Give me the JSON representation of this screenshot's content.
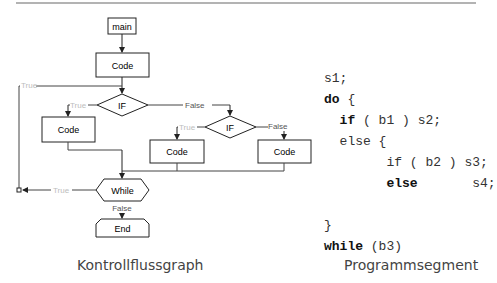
{
  "diagram": {
    "nodes": {
      "main": "main",
      "code_top": "Code",
      "if1": "IF",
      "code_left": "Code",
      "if2": "IF",
      "code_mid": "Code",
      "code_right": "Code",
      "while": "While",
      "end": "End"
    },
    "edge_labels": {
      "loop_true_top": "True",
      "if1_true": "True",
      "if1_false": "False",
      "if2_true": "True",
      "if2_false": "False",
      "while_true": "True",
      "while_false": "False"
    },
    "caption": "Kontrollflussgraph"
  },
  "program": {
    "lines": [
      {
        "indent": "",
        "kw": "",
        "rest": "s1;"
      },
      {
        "indent": "",
        "kw": "do",
        "rest": " {"
      },
      {
        "indent": "  ",
        "kw": "if",
        "rest": " ( b1 ) s2;"
      },
      {
        "indent": "  ",
        "kw": "",
        "rest": "else {"
      },
      {
        "indent": "        ",
        "kw": "",
        "rest": "if ( b2 ) s3;"
      },
      {
        "indent": "        ",
        "kw": "else",
        "rest": "       s4;"
      },
      {
        "indent": "",
        "kw": "",
        "rest": ""
      },
      {
        "indent": "",
        "kw": "",
        "rest": "}"
      },
      {
        "indent": "",
        "kw": "while",
        "rest": " (b3)"
      }
    ],
    "caption": "Programmsegment"
  }
}
